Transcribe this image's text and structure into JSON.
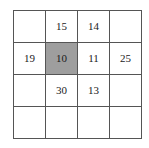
{
  "chart_data": {
    "type": "table",
    "title": "",
    "rows": 4,
    "columns": 4,
    "grid": [
      [
        "",
        "15",
        "14",
        ""
      ],
      [
        "19",
        "10",
        "11",
        "25"
      ],
      [
        "",
        "30",
        "13",
        ""
      ],
      [
        "",
        "",
        "",
        ""
      ]
    ],
    "highlighted_cells": [
      {
        "row": 1,
        "col": 1,
        "value": "10"
      }
    ],
    "values": [
      15,
      14,
      19,
      10,
      11,
      25,
      30,
      13
    ],
    "colors": {
      "cell_background": "#ffffff",
      "highlight_background": "#9e9e9e",
      "border": "#555555",
      "text": "#1a1a1a",
      "page_background": "#ffffff"
    }
  },
  "table": {
    "name": "number-grid",
    "rows": [
      {
        "cells": [
          {
            "value": "",
            "highlighted": false
          },
          {
            "value": "15",
            "highlighted": false
          },
          {
            "value": "14",
            "highlighted": false
          },
          {
            "value": "",
            "highlighted": false
          }
        ]
      },
      {
        "cells": [
          {
            "value": "19",
            "highlighted": false
          },
          {
            "value": "10",
            "highlighted": true
          },
          {
            "value": "11",
            "highlighted": false
          },
          {
            "value": "25",
            "highlighted": false
          }
        ]
      },
      {
        "cells": [
          {
            "value": "",
            "highlighted": false
          },
          {
            "value": "30",
            "highlighted": false
          },
          {
            "value": "13",
            "highlighted": false
          },
          {
            "value": "",
            "highlighted": false
          }
        ]
      },
      {
        "cells": [
          {
            "value": "",
            "highlighted": false
          },
          {
            "value": "",
            "highlighted": false
          },
          {
            "value": "",
            "highlighted": false
          },
          {
            "value": "",
            "highlighted": false
          }
        ]
      }
    ]
  }
}
